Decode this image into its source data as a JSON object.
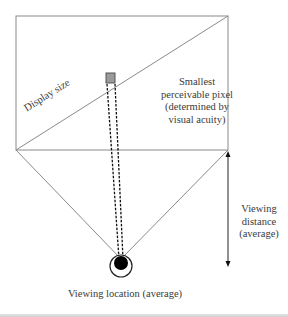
{
  "diagram": {
    "labels": {
      "display_size": "Display size",
      "smallest_pixel": [
        "Smallest",
        "perceivable pixel",
        "(determined by",
        "visual acuity)"
      ],
      "viewing_distance": [
        "Viewing",
        "distance",
        "(average)"
      ],
      "viewing_location": "Viewing location (average)"
    },
    "elements": {
      "display": {
        "x": 16,
        "y": 16,
        "width": 212,
        "height": 134
      },
      "pixel_box": {
        "x": 106,
        "y": 73,
        "width": 9,
        "height": 10,
        "fill": "#9a9a9a"
      },
      "eye": {
        "cx": 121,
        "cy": 266,
        "outer_r": 11,
        "pupil_r": 7
      },
      "distance_arrow": {
        "x": 228,
        "y1": 151,
        "y2": 266
      }
    },
    "colors": {
      "line": "#8a8a8a",
      "dark": "#111111",
      "pixel_fill": "#9a9a9a",
      "text": "#3a3a3a"
    }
  }
}
